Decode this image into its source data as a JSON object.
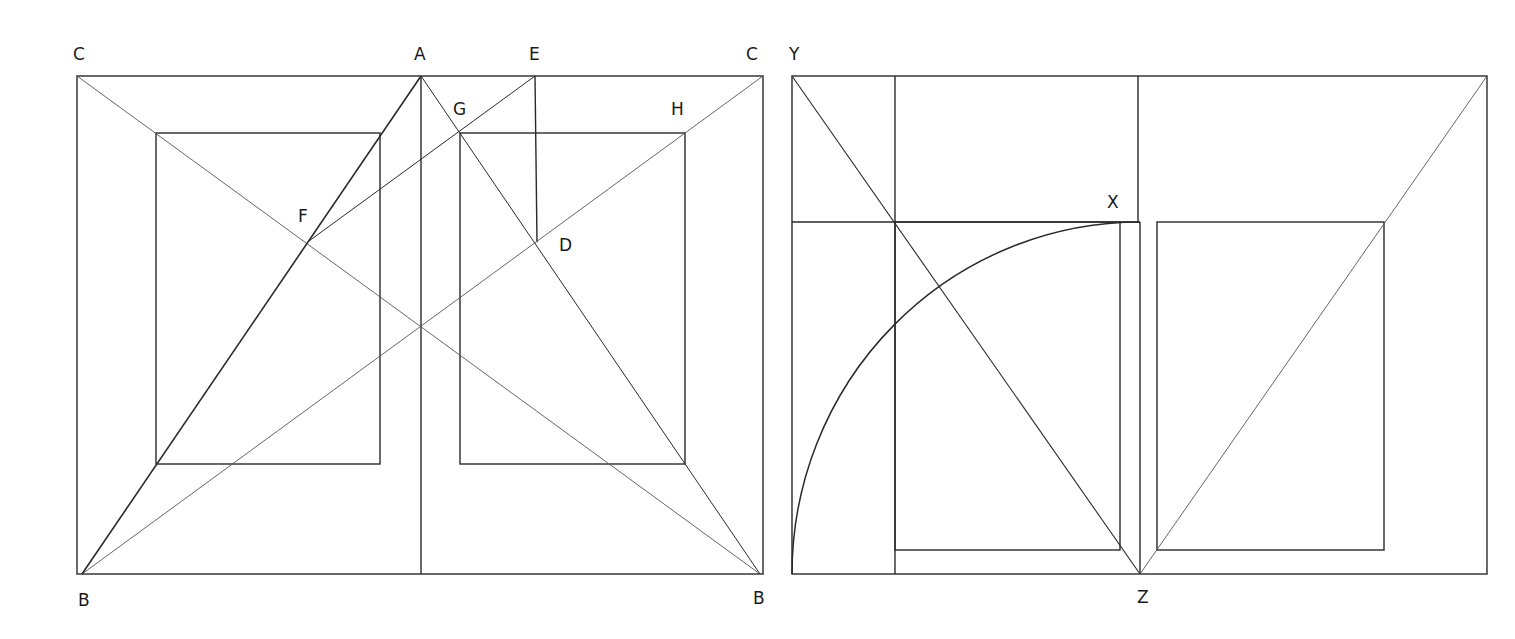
{
  "figure": {
    "left_diagram": {
      "labels": {
        "C_left": "C",
        "A": "A",
        "E": "E",
        "C_right": "C",
        "G": "G",
        "H": "H",
        "F": "F",
        "D": "D",
        "B_left": "B",
        "B_right": "B"
      }
    },
    "right_diagram": {
      "labels": {
        "Y": "Y",
        "X": "X",
        "Z": "Z"
      }
    },
    "colors": {
      "line": "#2a2a2a",
      "thin_line": "#555555",
      "background": "#ffffff",
      "label": "#1a1a1a"
    }
  }
}
